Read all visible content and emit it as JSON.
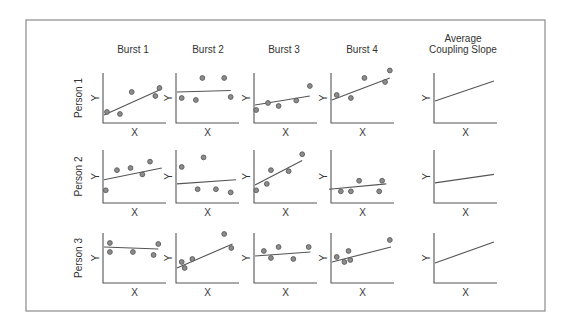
{
  "figure": {
    "frame_color": "#8a8a8a",
    "columns": [
      {
        "id": "burst1",
        "label_lines": [
          "Burst 1"
        ]
      },
      {
        "id": "burst2",
        "label_lines": [
          "Burst 2"
        ]
      },
      {
        "id": "burst3",
        "label_lines": [
          "Burst 3"
        ]
      },
      {
        "id": "burst4",
        "label_lines": [
          "Burst 4"
        ]
      },
      {
        "id": "average",
        "label_lines": [
          "Average",
          "Coupling Slope"
        ]
      }
    ],
    "rows": [
      {
        "id": "person1",
        "label": "Person 1"
      },
      {
        "id": "person2",
        "label": "Person 2"
      },
      {
        "id": "person3",
        "label": "Person 3"
      }
    ],
    "axis_labels": {
      "x": "X",
      "y": "Y"
    }
  },
  "chart_data": {
    "type": "scatter",
    "title": "",
    "xlabel": "X",
    "ylabel": "Y",
    "panels": [
      {
        "row": "Person 1",
        "col": "Burst 1",
        "points": [
          [
            0.05,
            0.22
          ],
          [
            0.27,
            0.18
          ],
          [
            0.47,
            0.62
          ],
          [
            0.87,
            0.54
          ],
          [
            0.94,
            0.7
          ]
        ],
        "line": [
          [
            0.0,
            0.16
          ],
          [
            0.94,
            0.66
          ]
        ]
      },
      {
        "row": "Person 1",
        "col": "Burst 2",
        "points": [
          [
            0.08,
            0.5
          ],
          [
            0.32,
            0.46
          ],
          [
            0.43,
            0.9
          ],
          [
            0.8,
            0.9
          ],
          [
            0.91,
            0.52
          ]
        ],
        "line": [
          [
            0.0,
            0.62
          ],
          [
            0.91,
            0.65
          ]
        ]
      },
      {
        "row": "Person 1",
        "col": "Burst 3",
        "points": [
          [
            0.02,
            0.26
          ],
          [
            0.22,
            0.4
          ],
          [
            0.4,
            0.34
          ],
          [
            0.7,
            0.45
          ],
          [
            0.93,
            0.74
          ]
        ],
        "line": [
          [
            0.0,
            0.36
          ],
          [
            0.93,
            0.54
          ]
        ]
      },
      {
        "row": "Person 1",
        "col": "Burst 4",
        "points": [
          [
            0.08,
            0.56
          ],
          [
            0.32,
            0.5
          ],
          [
            0.55,
            0.9
          ],
          [
            0.9,
            0.82
          ],
          [
            0.98,
            1.05
          ]
        ],
        "line": [
          [
            0.0,
            0.46
          ],
          [
            0.98,
            0.9
          ]
        ]
      },
      {
        "row": "Person 1",
        "col": "Average Coupling Slope",
        "points": [],
        "line": [
          [
            0.0,
            0.44
          ],
          [
            1.0,
            0.84
          ]
        ]
      },
      {
        "row": "Person 2",
        "col": "Burst 1",
        "points": [
          [
            0.03,
            0.24
          ],
          [
            0.22,
            0.62
          ],
          [
            0.45,
            0.66
          ],
          [
            0.65,
            0.54
          ],
          [
            0.78,
            0.78
          ]
        ],
        "line": [
          [
            0.0,
            0.44
          ],
          [
            0.98,
            0.66
          ]
        ]
      },
      {
        "row": "Person 2",
        "col": "Burst 2",
        "points": [
          [
            0.08,
            0.68
          ],
          [
            0.35,
            0.26
          ],
          [
            0.45,
            0.86
          ],
          [
            0.66,
            0.26
          ],
          [
            0.91,
            0.2
          ]
        ],
        "line": [
          [
            0.0,
            0.36
          ],
          [
            1.0,
            0.44
          ]
        ]
      },
      {
        "row": "Person 2",
        "col": "Burst 3",
        "points": [
          [
            0.02,
            0.24
          ],
          [
            0.2,
            0.36
          ],
          [
            0.27,
            0.62
          ],
          [
            0.57,
            0.6
          ],
          [
            0.8,
            0.92
          ]
        ],
        "line": [
          [
            0.0,
            0.34
          ],
          [
            0.8,
            0.8
          ]
        ]
      },
      {
        "row": "Person 2",
        "col": "Burst 4",
        "points": [
          [
            0.15,
            0.22
          ],
          [
            0.32,
            0.22
          ],
          [
            0.46,
            0.42
          ],
          [
            0.8,
            0.22
          ],
          [
            0.85,
            0.42
          ]
        ],
        "line": [
          [
            -0.05,
            0.26
          ],
          [
            0.92,
            0.36
          ]
        ]
      },
      {
        "row": "Person 2",
        "col": "Average Coupling Slope",
        "points": [],
        "line": [
          [
            0.0,
            0.38
          ],
          [
            1.0,
            0.54
          ]
        ]
      },
      {
        "row": "Person 3",
        "col": "Burst 1",
        "points": [
          [
            0.1,
            0.8
          ],
          [
            0.1,
            0.62
          ],
          [
            0.49,
            0.62
          ],
          [
            0.84,
            0.56
          ],
          [
            0.92,
            0.78
          ]
        ],
        "line": [
          [
            0.0,
            0.72
          ],
          [
            0.92,
            0.68
          ]
        ]
      },
      {
        "row": "Person 3",
        "col": "Burst 2",
        "points": [
          [
            0.08,
            0.42
          ],
          [
            0.13,
            0.3
          ],
          [
            0.26,
            0.48
          ],
          [
            0.8,
            0.98
          ],
          [
            0.92,
            0.7
          ]
        ],
        "line": [
          [
            0.0,
            0.3
          ],
          [
            0.94,
            0.78
          ]
        ]
      },
      {
        "row": "Person 3",
        "col": "Burst 3",
        "points": [
          [
            0.15,
            0.64
          ],
          [
            0.27,
            0.5
          ],
          [
            0.4,
            0.72
          ],
          [
            0.65,
            0.48
          ],
          [
            0.91,
            0.72
          ]
        ],
        "line": [
          [
            0.0,
            0.54
          ],
          [
            0.94,
            0.62
          ]
        ]
      },
      {
        "row": "Person 3",
        "col": "Burst 4",
        "points": [
          [
            0.08,
            0.52
          ],
          [
            0.21,
            0.42
          ],
          [
            0.28,
            0.64
          ],
          [
            0.31,
            0.46
          ],
          [
            0.98,
            0.86
          ]
        ],
        "line": [
          [
            0.0,
            0.42
          ],
          [
            1.0,
            0.72
          ]
        ]
      },
      {
        "row": "Person 3",
        "col": "Average Coupling Slope",
        "points": [],
        "line": [
          [
            0.0,
            0.4
          ],
          [
            1.0,
            0.82
          ]
        ]
      }
    ]
  }
}
